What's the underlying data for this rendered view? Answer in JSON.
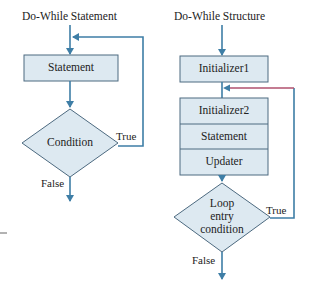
{
  "colors": {
    "box_fill": "#dde9f1",
    "box_stroke": "#4d6a80",
    "arrow": "#3e7ea6",
    "loop_accent": "#b0506e",
    "text": "#222222"
  },
  "left_diagram": {
    "title": "Do-While Statement",
    "statement_box": "Statement",
    "condition": "Condition",
    "true_label": "True",
    "false_label": "False"
  },
  "right_diagram": {
    "title": "Do-While Structure",
    "initializer1_box": "Initializer1",
    "stack_rows": [
      "Initializer2",
      "Statement",
      "Updater"
    ],
    "condition_lines": [
      "Loop",
      "entry",
      "condition"
    ],
    "true_label": "True",
    "false_label": "False"
  }
}
